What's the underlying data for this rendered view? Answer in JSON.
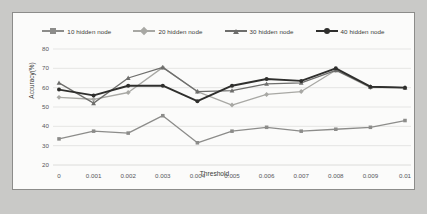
{
  "chart_data": {
    "type": "line",
    "title": "",
    "xlabel": "Threshold",
    "ylabel": "Accuracy(%)",
    "x": [
      0,
      0.001,
      0.002,
      0.003,
      0.004,
      0.005,
      0.006,
      0.007,
      0.008,
      0.009,
      0.01
    ],
    "xtick_labels": [
      "0",
      "0.001",
      "0.002",
      "0.003",
      "0.004",
      "0.005",
      "0.006",
      "0.007",
      "0.008",
      "0.009",
      "0.01"
    ],
    "ytick_labels": [
      "20",
      "30",
      "40",
      "50",
      "60",
      "70",
      "80"
    ],
    "yticks": [
      20,
      30,
      40,
      50,
      60,
      70,
      80
    ],
    "ylim": [
      20,
      80
    ],
    "grid": true,
    "legend_position": "top",
    "series": [
      {
        "name": "10 hidden node",
        "color": "#8c8c8a",
        "marker": "square",
        "values": [
          33.5,
          37.5,
          36.5,
          45.5,
          31.5,
          37.5,
          39.5,
          37.5,
          38.5,
          39.5,
          43.0
        ]
      },
      {
        "name": "20 hidden node",
        "color": "#a8a8a4",
        "marker": "diamond",
        "values": [
          55.0,
          54.0,
          57.5,
          70.5,
          58.0,
          51.0,
          56.5,
          58.0,
          69.0,
          60.0,
          60.0
        ]
      },
      {
        "name": "30 hidden node",
        "color": "#6e6e6c",
        "marker": "triangle",
        "values": [
          62.5,
          52.0,
          65.0,
          70.5,
          58.0,
          58.5,
          62.0,
          62.5,
          69.0,
          60.5,
          60.0
        ]
      },
      {
        "name": "40 hidden node",
        "color": "#2f2f2d",
        "marker": "circle",
        "values": [
          59.0,
          56.0,
          61.0,
          61.0,
          53.0,
          61.0,
          64.5,
          63.5,
          70.0,
          60.5,
          60.0
        ]
      }
    ]
  }
}
